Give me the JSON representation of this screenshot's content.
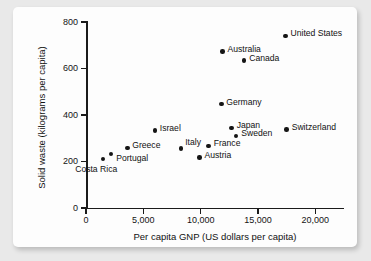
{
  "chart_data": {
    "type": "scatter",
    "title": "",
    "xlabel": "Per capita GNP (US dollars per capita)",
    "ylabel": "Solid waste (kilograms per capita)",
    "xlim": [
      0,
      22500
    ],
    "ylim": [
      0,
      800
    ],
    "xticks": [
      0,
      5000,
      10000,
      15000,
      20000
    ],
    "xtick_labels": [
      "0",
      "5,000",
      "10,000",
      "15,000",
      "20,000"
    ],
    "yticks": [
      0,
      200,
      400,
      600,
      800
    ],
    "ytick_labels": [
      "0",
      "200",
      "400",
      "600",
      "800"
    ],
    "grid": false,
    "legend": false,
    "marker_color": "#151515",
    "points": [
      {
        "label": "Costa Rica",
        "x": 1500,
        "y": 210,
        "label_dx": -28,
        "label_dy": 10
      },
      {
        "label": "Portugal",
        "x": 2200,
        "y": 232,
        "label_dx": 5,
        "label_dy": 4
      },
      {
        "label": "Greece",
        "x": 3600,
        "y": 259,
        "label_dx": 5,
        "label_dy": -2
      },
      {
        "label": "Israel",
        "x": 6000,
        "y": 333,
        "label_dx": 5,
        "label_dy": -2
      },
      {
        "label": "Italy",
        "x": 8300,
        "y": 255,
        "label_dx": 4,
        "label_dy": -6
      },
      {
        "label": "Austria",
        "x": 9900,
        "y": 218,
        "label_dx": 5,
        "label_dy": -2
      },
      {
        "label": "France",
        "x": 10700,
        "y": 267,
        "label_dx": 5,
        "label_dy": -2
      },
      {
        "label": "Germany",
        "x": 11800,
        "y": 447,
        "label_dx": 5,
        "label_dy": -2
      },
      {
        "label": "Australia",
        "x": 11900,
        "y": 673,
        "label_dx": 5,
        "label_dy": -2
      },
      {
        "label": "Japan",
        "x": 12700,
        "y": 345,
        "label_dx": 5,
        "label_dy": -2
      },
      {
        "label": "Sweden",
        "x": 13100,
        "y": 310,
        "label_dx": 5,
        "label_dy": -2
      },
      {
        "label": "Canada",
        "x": 13800,
        "y": 635,
        "label_dx": 5,
        "label_dy": -2
      },
      {
        "label": "Switzerland",
        "x": 17500,
        "y": 338,
        "label_dx": 5,
        "label_dy": -2
      },
      {
        "label": "United States",
        "x": 17400,
        "y": 740,
        "label_dx": 5,
        "label_dy": -2
      }
    ]
  }
}
